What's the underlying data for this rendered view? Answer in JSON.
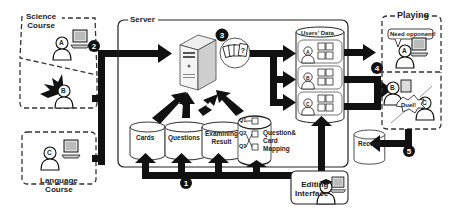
{
  "groups": {
    "science_course": "Science",
    "science_course_2": "Course",
    "language_course": "Language",
    "language_course_2": "Course",
    "server": "Server",
    "playing": "Playing",
    "editing_interface": "Editing",
    "editing_interface_2": "Interface"
  },
  "users": {
    "a": "A",
    "b": "B",
    "c": "C"
  },
  "databases": {
    "cards": "Cards",
    "questions": "Questions",
    "examining_result_1": "Examining",
    "examining_result_2": "Result",
    "mapping_label_1": "Question&",
    "mapping_label_2": "Card",
    "mapping_label_3": "Mapping",
    "users_data": "Users' Data",
    "record": "Record"
  },
  "mapping": {
    "questions": [
      "Q1",
      "Q2",
      "Q3"
    ]
  },
  "playing": {
    "speech_bubble": "Need opponent!",
    "duel": "Duel!"
  },
  "card_icon": "?",
  "steps": [
    "1",
    "2",
    "3",
    "4",
    "5"
  ],
  "colors": {
    "ink": "#111111",
    "dashed": "#333333",
    "panel_border": "#222222",
    "background": "#ffffff"
  }
}
